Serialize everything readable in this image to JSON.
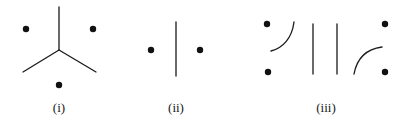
{
  "figure": {
    "background_color": "#ffffff",
    "stroke_color": "#1a1a1a",
    "dot_color": "#111111",
    "width": 407,
    "height": 123,
    "panels": [
      {
        "id": "i",
        "caption": "(i)",
        "description": "Y-shaped three-way junction with three dots",
        "dots": [
          {
            "name": "dot-upper-left",
            "cx": 26,
            "cy": 29,
            "r": 3.2
          },
          {
            "name": "dot-upper-right",
            "cx": 93,
            "cy": 29,
            "r": 3.2
          },
          {
            "name": "dot-bottom",
            "cx": 59,
            "cy": 85,
            "r": 3.2
          }
        ],
        "strokes": [
          {
            "name": "y-stem-vertical",
            "type": "line",
            "x1": 59,
            "y1": 7,
            "x2": 59,
            "y2": 50
          },
          {
            "name": "y-arm-lower-left",
            "type": "line",
            "x1": 59,
            "y1": 50,
            "x2": 23,
            "y2": 72
          },
          {
            "name": "y-arm-lower-right",
            "type": "line",
            "x1": 59,
            "y1": 50,
            "x2": 96,
            "y2": 72
          }
        ]
      },
      {
        "id": "ii",
        "caption": "(ii)",
        "description": "Single vertical line with one dot on each side",
        "dots": [
          {
            "name": "dot-left",
            "cx": 151,
            "cy": 50,
            "r": 3.2
          },
          {
            "name": "dot-right",
            "cx": 200,
            "cy": 50,
            "r": 3.2
          }
        ],
        "strokes": [
          {
            "name": "vertical-line",
            "type": "line",
            "x1": 176,
            "y1": 22,
            "x2": 176,
            "y2": 76
          }
        ]
      },
      {
        "id": "iii",
        "caption": "(iii)",
        "description": "Four dots with two arcs and two vertical lines",
        "dots": [
          {
            "name": "dot-left-upper",
            "cx": 267,
            "cy": 24,
            "r": 3.2
          },
          {
            "name": "dot-left-lower",
            "cx": 268,
            "cy": 72,
            "r": 3.2
          },
          {
            "name": "dot-right-upper",
            "cx": 385,
            "cy": 24,
            "r": 3.2
          },
          {
            "name": "dot-right-lower",
            "cx": 385,
            "cy": 72,
            "r": 3.2
          }
        ],
        "strokes": [
          {
            "name": "arc-left",
            "type": "path",
            "d": "M 294 22 C 292 38 283 48 271 51"
          },
          {
            "name": "vertical-line-inner-left",
            "type": "line",
            "x1": 313,
            "y1": 24,
            "x2": 313,
            "y2": 74
          },
          {
            "name": "vertical-line-inner-right",
            "type": "line",
            "x1": 337,
            "y1": 24,
            "x2": 337,
            "y2": 74
          },
          {
            "name": "arc-right",
            "type": "path",
            "d": "M 354 74 C 357 58 367 49 382 47"
          }
        ]
      }
    ]
  }
}
